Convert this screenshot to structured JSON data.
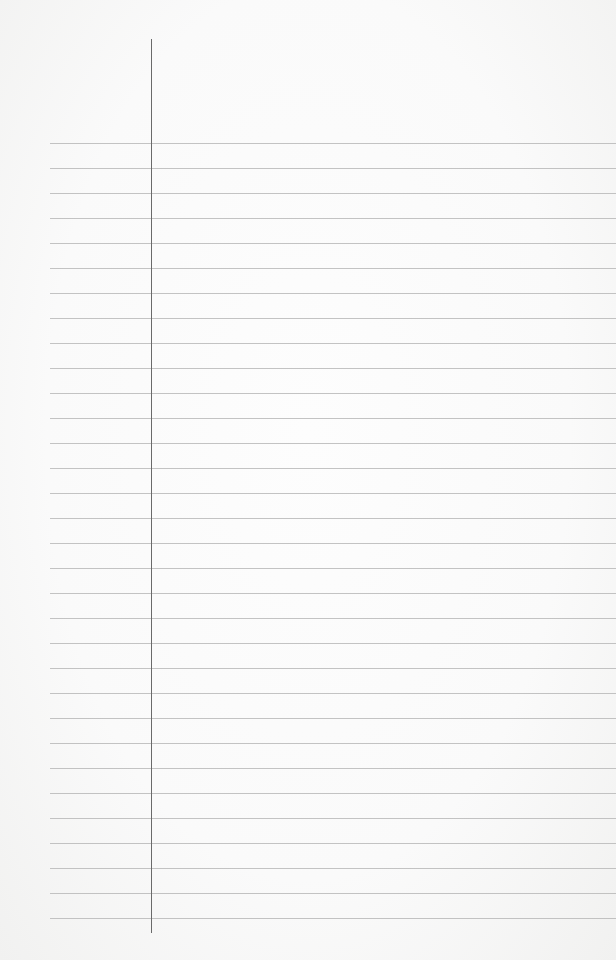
{
  "paper": {
    "type": "lined-notebook-paper",
    "background_color": "#f9f9f8",
    "rule_color": "#b9b9b9",
    "margin_line_color": "#6a6a6a",
    "rule_count": 32,
    "first_rule_y": 143,
    "rule_spacing": 25,
    "rule_left_x": 50,
    "margin_line_x": 151,
    "margin_line_top": 39,
    "margin_line_bottom": 933
  }
}
